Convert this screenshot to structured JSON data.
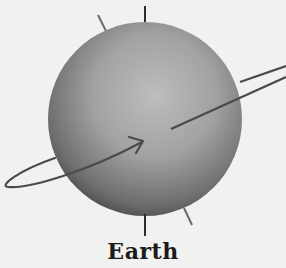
{
  "diagram": {
    "title": "Earth",
    "colors": {
      "background": "#f1f1ef",
      "sphere_light": "#bdbdbd",
      "sphere_mid": "#8f8f8f",
      "sphere_dark": "#3a3a3a",
      "lines": "#4a4a4a"
    },
    "elements": [
      "sphere",
      "vertical-axis",
      "tilted-axis",
      "rotation-arrow-orbit"
    ]
  }
}
